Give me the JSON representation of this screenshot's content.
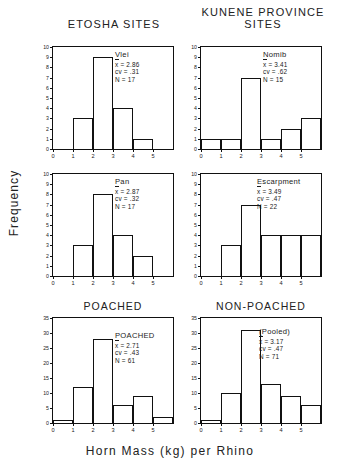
{
  "figure": {
    "xlabel": "Horn Mass (kg) per Rhino",
    "ylabel": "Frequency",
    "group_titles": {
      "left": "ETOSHA SITES",
      "right": "KUNENE PROVINCE\nSITES"
    },
    "panel_headings": {
      "poached": "POACHED",
      "non_poached": "NON-POACHED"
    }
  },
  "chart_data": [
    {
      "type": "bar",
      "title": "Vlei",
      "group": "ETOSHA SITES",
      "xlabel": "Horn Mass (kg) per Rhino",
      "ylabel": "Frequency",
      "categories": [
        "0-1",
        "1-2",
        "2-3",
        "3-4",
        "4-5",
        "5-6"
      ],
      "x_tick_labels": [
        "0",
        "1",
        "2",
        "3",
        "4",
        "5"
      ],
      "values": [
        0,
        3,
        9,
        4,
        1,
        0
      ],
      "xlim": [
        0,
        6
      ],
      "ylim": [
        0,
        10
      ],
      "y_tick_labels": [
        "0",
        "1",
        "2",
        "3",
        "4",
        "5",
        "6",
        "7",
        "8",
        "9",
        "10"
      ],
      "grid": false,
      "stats": {
        "mean_label": "x",
        "mean_value": "2.86",
        "cv_label": "cv",
        "cv_value": ".31",
        "n_label": "N",
        "n_value": "17"
      }
    },
    {
      "type": "bar",
      "title": "Nomib",
      "group": "KUNENE PROVINCE SITES",
      "xlabel": "Horn Mass (kg) per Rhino",
      "ylabel": "Frequency",
      "categories": [
        "0-1",
        "1-2",
        "2-3",
        "3-4",
        "4-5",
        "5-6"
      ],
      "x_tick_labels": [
        "0",
        "1",
        "2",
        "3",
        "4",
        "5"
      ],
      "values": [
        1,
        1,
        7,
        1,
        2,
        3
      ],
      "xlim": [
        0,
        6
      ],
      "ylim": [
        0,
        10
      ],
      "y_tick_labels": [
        "0",
        "1",
        "2",
        "3",
        "4",
        "5",
        "6",
        "7",
        "8",
        "9",
        "10"
      ],
      "grid": false,
      "stats": {
        "mean_label": "x",
        "mean_value": "3.41",
        "cv_label": "cv",
        "cv_value": ".62",
        "n_label": "N",
        "n_value": "15"
      }
    },
    {
      "type": "bar",
      "title": "Pan",
      "group": "ETOSHA SITES",
      "xlabel": "Horn Mass (kg) per Rhino",
      "ylabel": "Frequency",
      "categories": [
        "0-1",
        "1-2",
        "2-3",
        "3-4",
        "4-5",
        "5-6"
      ],
      "x_tick_labels": [
        "0",
        "1",
        "2",
        "3",
        "4",
        "5"
      ],
      "values": [
        0,
        3,
        8,
        4,
        2,
        0
      ],
      "xlim": [
        0,
        6
      ],
      "ylim": [
        0,
        10
      ],
      "y_tick_labels": [
        "0",
        "1",
        "2",
        "3",
        "4",
        "5",
        "6",
        "7",
        "8",
        "9",
        "10"
      ],
      "grid": false,
      "stats": {
        "mean_label": "x",
        "mean_value": "2.87",
        "cv_label": "cv",
        "cv_value": ".32",
        "n_label": "N",
        "n_value": "17"
      }
    },
    {
      "type": "bar",
      "title": "Escarpment",
      "group": "KUNENE PROVINCE SITES",
      "xlabel": "Horn Mass (kg) per Rhino",
      "ylabel": "Frequency",
      "categories": [
        "0-1",
        "1-2",
        "2-3",
        "3-4",
        "4-5",
        "5-6"
      ],
      "x_tick_labels": [
        "0",
        "1",
        "2",
        "3",
        "4",
        "5"
      ],
      "values": [
        0,
        3,
        7,
        4,
        4,
        4
      ],
      "xlim": [
        0,
        6
      ],
      "ylim": [
        0,
        10
      ],
      "y_tick_labels": [
        "0",
        "1",
        "2",
        "3",
        "4",
        "5",
        "6",
        "7",
        "8",
        "9",
        "10"
      ],
      "grid": false,
      "stats": {
        "mean_label": "x",
        "mean_value": "3.49",
        "cv_label": "cv",
        "cv_value": ".47",
        "n_label": "N",
        "n_value": "22"
      }
    },
    {
      "type": "bar",
      "title": "POACHED",
      "group": "POACHED",
      "xlabel": "Horn Mass (kg) per Rhino",
      "ylabel": "Frequency",
      "categories": [
        "0-1",
        "1-2",
        "2-3",
        "3-4",
        "4-5",
        "5-6"
      ],
      "x_tick_labels": [
        "0",
        "1",
        "2",
        "3",
        "4",
        "5"
      ],
      "values": [
        1,
        12,
        28,
        6,
        9,
        2
      ],
      "xlim": [
        0,
        6
      ],
      "ylim": [
        0,
        35
      ],
      "y_tick_labels": [
        "0",
        "5",
        "10",
        "15",
        "20",
        "25",
        "30",
        "35"
      ],
      "grid": false,
      "stats": {
        "mean_label": "x",
        "mean_value": "2.71",
        "cv_label": "cv",
        "cv_value": ".43",
        "n_label": "N",
        "n_value": "61"
      }
    },
    {
      "type": "bar",
      "title": "(Pooled)",
      "group": "NON-POACHED",
      "xlabel": "Horn Mass (kg) per Rhino",
      "ylabel": "Frequency",
      "categories": [
        "0-1",
        "1-2",
        "2-3",
        "3-4",
        "4-5",
        "5-6"
      ],
      "x_tick_labels": [
        "0",
        "1",
        "2",
        "3",
        "4",
        "5"
      ],
      "values": [
        1,
        10,
        31,
        13,
        9,
        6
      ],
      "xlim": [
        0,
        6
      ],
      "ylim": [
        0,
        35
      ],
      "y_tick_labels": [
        "0",
        "5",
        "10",
        "15",
        "20",
        "25",
        "30",
        "35"
      ],
      "grid": false,
      "stats": {
        "mean_label": "x",
        "mean_value": "3.17",
        "cv_label": "cv",
        "cv_value": ".47",
        "n_label": "N",
        "n_value": "71"
      }
    }
  ]
}
